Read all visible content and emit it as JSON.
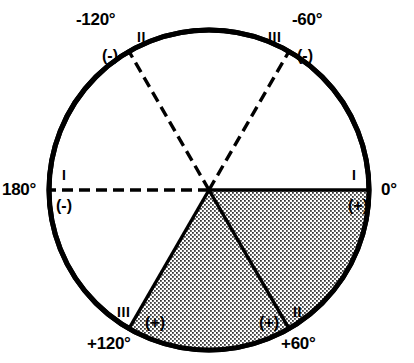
{
  "figure": {
    "type": "polar-sector-diagram",
    "title": "",
    "circle": {
      "center_x": 209,
      "center_y": 190,
      "radius": 162,
      "stroke_color": "#000000",
      "stroke_width": 5,
      "fill_color": "#ffffff"
    },
    "shaded_region": {
      "from_angle": 0,
      "to_angle": 120,
      "pattern": "stipple-dots",
      "fill_color": "#d9d9d9",
      "dot_color": "#000000"
    },
    "boundaries": [
      {
        "angle_label": "0°",
        "angle_value": 0,
        "style": "solid",
        "roman": "I",
        "sign": "(+)",
        "side": "right"
      },
      {
        "angle_label": "+60°",
        "angle_value": 60,
        "style": "solid",
        "roman": "II",
        "sign": "(+)",
        "side": "bottom-right"
      },
      {
        "angle_label": "+120°",
        "angle_value": 120,
        "style": "solid",
        "roman": "III",
        "sign": "(+)",
        "side": "bottom-left"
      },
      {
        "angle_label": "180°",
        "angle_value": 180,
        "style": "dashed",
        "roman": "I",
        "sign": "(-)",
        "side": "left"
      },
      {
        "angle_label": "-120°",
        "angle_value": -120,
        "style": "dashed",
        "roman": "II",
        "sign": "(-)",
        "side": "top-left"
      },
      {
        "angle_label": "-60°",
        "angle_value": -60,
        "style": "dashed",
        "roman": "III",
        "sign": "(-)",
        "side": "top-right"
      }
    ],
    "labels": {
      "deg_minus_120": "-120°",
      "deg_minus_60": "-60°",
      "deg_180": "180°",
      "deg_0": "0°",
      "deg_plus_120": "+120°",
      "deg_plus_60": "+60°",
      "roman_minus_120": "II",
      "roman_minus_60": "III",
      "roman_180": "I",
      "roman_0": "I",
      "roman_plus_120": "III",
      "roman_plus_60": "II",
      "sign_minus_120": "(-)",
      "sign_minus_60": "(-)",
      "sign_180": "(-)",
      "sign_0": "(+)",
      "sign_plus_120": "(+)",
      "sign_plus_60": "(+)"
    }
  }
}
